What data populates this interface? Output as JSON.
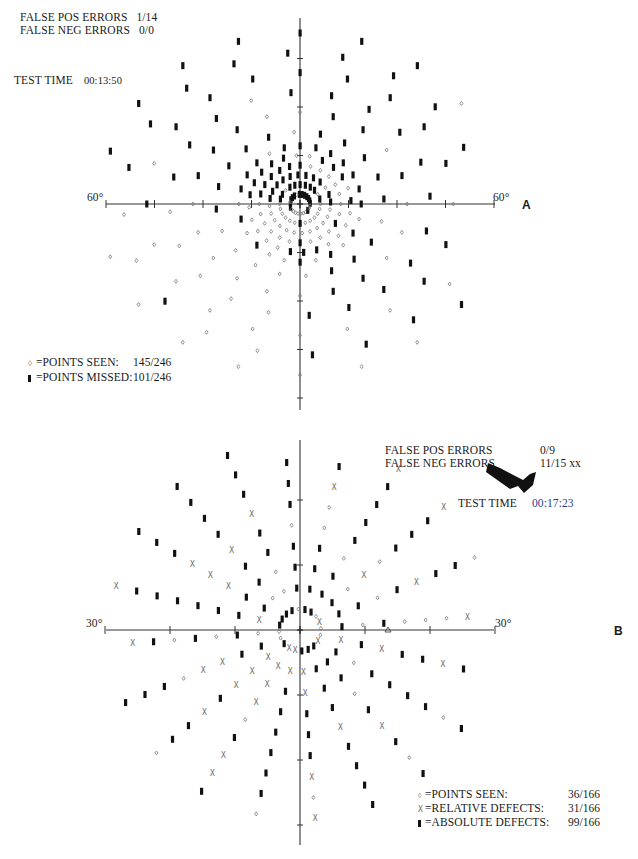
{
  "panelA": {
    "letter": "A",
    "false_pos_label": "FALSE POS ERRORS",
    "false_pos_value": "1/14",
    "false_neg_label": "FALSE NEG ERRORS",
    "false_neg_value": "0/0",
    "test_time_label": "TEST TIME",
    "test_time_value": "00:13:50",
    "axis_left_label": "60°",
    "axis_right_label": "60°",
    "legend": [
      {
        "symbol": "seen",
        "label": "=POINTS SEEN:",
        "value": "145/246"
      },
      {
        "symbol": "missed",
        "label": "=POINTS MISSED:",
        "value": "101/246"
      }
    ]
  },
  "panelB": {
    "letter": "B",
    "false_pos_label": "FALSE POS ERRORS",
    "false_pos_value": "0/9",
    "false_neg_label": "FALSE NEG ERRORS",
    "false_neg_value": "11/15 xx",
    "test_time_label": "TEST TIME",
    "test_time_value": "00:17:23",
    "axis_left_label": "30°",
    "axis_right_label": "30°",
    "legend": [
      {
        "symbol": "seen",
        "label": "=POINTS SEEN:",
        "value": "36/166"
      },
      {
        "symbol": "relative",
        "label": "=RELATIVE DEFECTS:",
        "value": "31/166"
      },
      {
        "symbol": "absolute",
        "label": "=ABSOLUTE DEFECTS:",
        "value": "99/166"
      }
    ]
  },
  "chart_data": [
    {
      "type": "scatter",
      "title": "Visual field A (60° perimetry)",
      "xlabel": "60° ← → 60°",
      "ylabel": "",
      "xlim": [
        -60,
        60
      ],
      "ylim": [
        -60,
        60
      ],
      "grid": false,
      "legend_position": "bottom-left",
      "series": [
        {
          "name": "Points seen",
          "count": 145,
          "total": 246,
          "marker": "small-diamond"
        },
        {
          "name": "Points missed",
          "count": 101,
          "total": 246,
          "marker": "filled-rect"
        }
      ],
      "annotations": [
        "FALSE POS ERRORS 1/14",
        "FALSE NEG ERRORS 0/0",
        "TEST TIME 00:13:50"
      ]
    },
    {
      "type": "scatter",
      "title": "Visual field B (30° perimetry)",
      "xlabel": "30° ← → 30°",
      "ylabel": "",
      "xlim": [
        -30,
        30
      ],
      "ylim": [
        -30,
        30
      ],
      "grid": false,
      "legend_position": "bottom-right",
      "series": [
        {
          "name": "Points seen",
          "count": 36,
          "total": 166,
          "marker": "small-diamond"
        },
        {
          "name": "Relative defects",
          "count": 31,
          "total": 166,
          "marker": "X"
        },
        {
          "name": "Absolute defects",
          "count": 99,
          "total": 166,
          "marker": "filled-rect"
        }
      ],
      "annotations": [
        "FALSE POS ERRORS 0/9",
        "FALSE NEG ERRORS 11/15 xx",
        "TEST TIME 00:17:23"
      ]
    }
  ],
  "colors": {
    "ink": "#1a1a1a",
    "seen": "#777777",
    "missed": "#111111",
    "time_b": "#1f3f8a"
  }
}
